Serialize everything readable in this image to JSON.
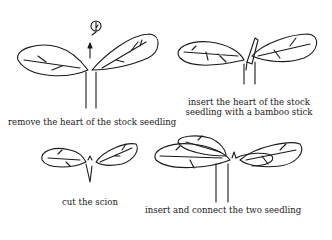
{
  "diagram": {
    "panels": [
      {
        "id": "step1",
        "caption": "remove the heart of the stock seedling"
      },
      {
        "id": "step2",
        "caption_line1": "insert the heart of the stock",
        "caption_line2": "seedling with a bamboo stick"
      },
      {
        "id": "step3",
        "caption": "cut the scion"
      },
      {
        "id": "step4",
        "caption": "insert and connect the two seedling"
      }
    ],
    "colors": {
      "ink": "#1a1a1a",
      "background": "#ffffff"
    }
  }
}
